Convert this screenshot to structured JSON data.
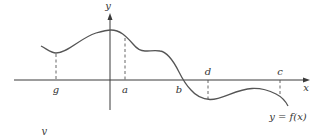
{
  "diagram": {
    "title": "",
    "axes": {
      "x_label": "x",
      "y_label": "y"
    },
    "curve_label": "y = f(x)",
    "points": {
      "g": "g",
      "a": "a",
      "b": "b",
      "d": "d",
      "c": "c"
    },
    "stray_label": "y",
    "colors": {
      "axis": "#3a3a3a",
      "curve": "#555555",
      "text": "#333333",
      "background": "#ffffff"
    }
  }
}
